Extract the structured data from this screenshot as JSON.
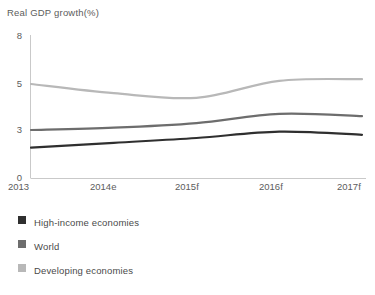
{
  "chart_data": {
    "type": "line",
    "title": "Real GDP growth(%)",
    "xlabel": "",
    "ylabel": "",
    "x": [
      "2013",
      "2014e",
      "2015f",
      "2016f",
      "2017f"
    ],
    "categories": [
      "2013",
      "2014e",
      "2015f",
      "2016f",
      "2017f"
    ],
    "yticks": [
      0,
      3,
      5,
      8
    ],
    "ylim": [
      0,
      8
    ],
    "grid": false,
    "legend_position": "below-left",
    "series": [
      {
        "name": "High-income economies",
        "color": "#2f2f2f",
        "values": [
          1.9,
          2.2,
          2.5,
          2.9,
          2.7
        ]
      },
      {
        "name": "World",
        "color": "#6d6d6d",
        "values": [
          3.0,
          3.1,
          3.3,
          3.7,
          3.6
        ]
      },
      {
        "name": "Developing economies",
        "color": "#b8b8b8",
        "values": [
          5.0,
          4.6,
          4.4,
          5.2,
          5.3
        ]
      }
    ]
  },
  "chart": {
    "title": "Real GDP growth(%)",
    "y_tick_labels": [
      "8",
      "5",
      "3",
      "0"
    ],
    "x_tick_labels": [
      "2013",
      "2014e",
      "2015f",
      "2016f",
      "2017f"
    ],
    "axis_color": "#c9c9c9"
  },
  "legend": {
    "items": [
      {
        "label": "High-income economies",
        "color": "#2f2f2f"
      },
      {
        "label": "World",
        "color": "#6d6d6d"
      },
      {
        "label": "Developing economies",
        "color": "#b8b8b8"
      }
    ]
  }
}
